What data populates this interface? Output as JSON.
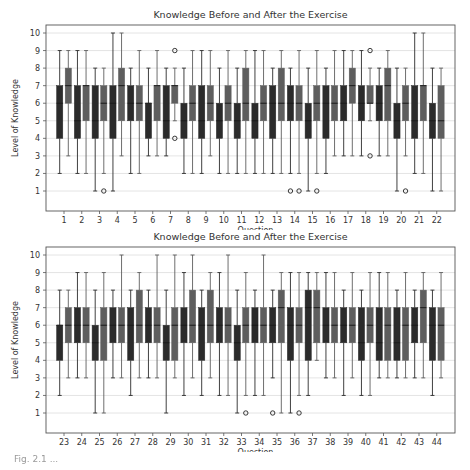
{
  "chart_data": [
    {
      "type": "box",
      "title": "Knowledge Before and After the Exercise",
      "xlabel": "Question",
      "ylabel": "Level of Knowledge",
      "ylim": [
        0,
        10.5
      ],
      "yticks": [
        1,
        2,
        3,
        4,
        5,
        6,
        7,
        8,
        9,
        10
      ],
      "grid": "horizontal",
      "legend": null,
      "series_names": [
        "Before",
        "After"
      ],
      "categories": [
        "1",
        "2",
        "3",
        "4",
        "5",
        "6",
        "7",
        "8",
        "9",
        "10",
        "11",
        "12",
        "13",
        "14",
        "15",
        "16",
        "17",
        "18",
        "19",
        "20",
        "21",
        "22"
      ],
      "boxes": [
        {
          "q": "1",
          "before": {
            "whislo": 2,
            "q1": 4,
            "med": 6,
            "q3": 7,
            "whishi": 9,
            "fliers": []
          },
          "after": {
            "whislo": 3,
            "q1": 6,
            "med": 7,
            "q3": 8,
            "whishi": 9,
            "fliers": []
          }
        },
        {
          "q": "2",
          "before": {
            "whislo": 2,
            "q1": 4,
            "med": 5,
            "q3": 7,
            "whishi": 9,
            "fliers": []
          },
          "after": {
            "whislo": 2,
            "q1": 5,
            "med": 7,
            "q3": 7,
            "whishi": 9,
            "fliers": []
          }
        },
        {
          "q": "3",
          "before": {
            "whislo": 1,
            "q1": 4,
            "med": 5,
            "q3": 7,
            "whishi": 8,
            "fliers": []
          },
          "after": {
            "whislo": 2,
            "q1": 5,
            "med": 6,
            "q3": 7,
            "whishi": 8,
            "fliers": [
              1
            ]
          }
        },
        {
          "q": "4",
          "before": {
            "whislo": 1,
            "q1": 4,
            "med": 6,
            "q3": 7,
            "whishi": 10,
            "fliers": []
          },
          "after": {
            "whislo": 3,
            "q1": 5,
            "med": 7,
            "q3": 8,
            "whishi": 10,
            "fliers": []
          }
        },
        {
          "q": "5",
          "before": {
            "whislo": 2,
            "q1": 5,
            "med": 6,
            "q3": 7,
            "whishi": 8,
            "fliers": []
          },
          "after": {
            "whislo": 2,
            "q1": 5,
            "med": 6,
            "q3": 7,
            "whishi": 9,
            "fliers": []
          }
        },
        {
          "q": "6",
          "before": {
            "whislo": 3,
            "q1": 4,
            "med": 6,
            "q3": 6,
            "whishi": 8,
            "fliers": []
          },
          "after": {
            "whislo": 3,
            "q1": 5,
            "med": 7,
            "q3": 7,
            "whishi": 9,
            "fliers": []
          }
        },
        {
          "q": "7",
          "before": {
            "whislo": 3,
            "q1": 4,
            "med": 5,
            "q3": 7,
            "whishi": 8,
            "fliers": []
          },
          "after": {
            "whislo": 5,
            "q1": 6,
            "med": 7,
            "q3": 7,
            "whishi": 8,
            "fliers": [
              4,
              9
            ]
          }
        },
        {
          "q": "8",
          "before": {
            "whislo": 2,
            "q1": 4,
            "med": 5,
            "q3": 6,
            "whishi": 8,
            "fliers": []
          },
          "after": {
            "whislo": 2,
            "q1": 5,
            "med": 6,
            "q3": 7,
            "whishi": 9,
            "fliers": []
          }
        },
        {
          "q": "9",
          "before": {
            "whislo": 2,
            "q1": 4,
            "med": 5,
            "q3": 7,
            "whishi": 9,
            "fliers": []
          },
          "after": {
            "whislo": 3,
            "q1": 5,
            "med": 6,
            "q3": 7,
            "whishi": 9,
            "fliers": []
          }
        },
        {
          "q": "10",
          "before": {
            "whislo": 2,
            "q1": 4,
            "med": 5,
            "q3": 6,
            "whishi": 8,
            "fliers": []
          },
          "after": {
            "whislo": 2,
            "q1": 5,
            "med": 6,
            "q3": 7,
            "whishi": 9,
            "fliers": []
          }
        },
        {
          "q": "11",
          "before": {
            "whislo": 2,
            "q1": 4,
            "med": 5,
            "q3": 6,
            "whishi": 8,
            "fliers": []
          },
          "after": {
            "whislo": 2,
            "q1": 5,
            "med": 6,
            "q3": 8,
            "whishi": 9,
            "fliers": []
          }
        },
        {
          "q": "12",
          "before": {
            "whislo": 2,
            "q1": 4,
            "med": 5,
            "q3": 6,
            "whishi": 9,
            "fliers": []
          },
          "after": {
            "whislo": 2,
            "q1": 5,
            "med": 6,
            "q3": 7,
            "whishi": 9,
            "fliers": []
          }
        },
        {
          "q": "13",
          "before": {
            "whislo": 2,
            "q1": 4,
            "med": 6,
            "q3": 7,
            "whishi": 8,
            "fliers": []
          },
          "after": {
            "whislo": 2,
            "q1": 5,
            "med": 6,
            "q3": 8,
            "whishi": 9,
            "fliers": []
          }
        },
        {
          "q": "14",
          "before": {
            "whislo": 2,
            "q1": 5,
            "med": 6,
            "q3": 7,
            "whishi": 8,
            "fliers": [
              1
            ]
          },
          "after": {
            "whislo": 2,
            "q1": 5,
            "med": 6,
            "q3": 7,
            "whishi": 9,
            "fliers": [
              1
            ]
          }
        },
        {
          "q": "15",
          "before": {
            "whislo": 1,
            "q1": 4,
            "med": 5,
            "q3": 6,
            "whishi": 8,
            "fliers": []
          },
          "after": {
            "whislo": 2,
            "q1": 5,
            "med": 6,
            "q3": 7,
            "whishi": 9,
            "fliers": [
              1
            ]
          }
        },
        {
          "q": "16",
          "before": {
            "whislo": 2,
            "q1": 4,
            "med": 6,
            "q3": 7,
            "whishi": 8,
            "fliers": []
          },
          "after": {
            "whislo": 3,
            "q1": 5,
            "med": 6,
            "q3": 7,
            "whishi": 9,
            "fliers": []
          }
        },
        {
          "q": "17",
          "before": {
            "whislo": 3,
            "q1": 5,
            "med": 6,
            "q3": 7,
            "whishi": 9,
            "fliers": []
          },
          "after": {
            "whislo": 3,
            "q1": 6,
            "med": 7,
            "q3": 8,
            "whishi": 9,
            "fliers": []
          }
        },
        {
          "q": "18",
          "before": {
            "whislo": 3,
            "q1": 5,
            "med": 6,
            "q3": 7,
            "whishi": 9,
            "fliers": []
          },
          "after": {
            "whislo": 5,
            "q1": 6,
            "med": 6,
            "q3": 7,
            "whishi": 8,
            "fliers": [
              3,
              9
            ]
          }
        },
        {
          "q": "19",
          "before": {
            "whislo": 3,
            "q1": 5,
            "med": 6,
            "q3": 7,
            "whishi": 8,
            "fliers": []
          },
          "after": {
            "whislo": 3,
            "q1": 5,
            "med": 7,
            "q3": 8,
            "whishi": 9,
            "fliers": []
          }
        },
        {
          "q": "20",
          "before": {
            "whislo": 1,
            "q1": 4,
            "med": 5,
            "q3": 6,
            "whishi": 8,
            "fliers": []
          },
          "after": {
            "whislo": 3,
            "q1": 5,
            "med": 6,
            "q3": 7,
            "whishi": 8,
            "fliers": [
              1
            ]
          }
        },
        {
          "q": "21",
          "before": {
            "whislo": 2,
            "q1": 4,
            "med": 5,
            "q3": 7,
            "whishi": 10,
            "fliers": []
          },
          "after": {
            "whislo": 2,
            "q1": 5,
            "med": 7,
            "q3": 7,
            "whishi": 10,
            "fliers": []
          }
        },
        {
          "q": "22",
          "before": {
            "whislo": 1,
            "q1": 4,
            "med": 5,
            "q3": 6,
            "whishi": 8,
            "fliers": []
          },
          "after": {
            "whislo": 1,
            "q1": 4,
            "med": 5,
            "q3": 7,
            "whishi": 8,
            "fliers": []
          }
        }
      ]
    },
    {
      "type": "box",
      "title": "Knowledge Before and After the Exercise",
      "xlabel": "Question",
      "ylabel": "Level of Knowledge",
      "ylim": [
        0,
        10.5
      ],
      "yticks": [
        1,
        2,
        3,
        4,
        5,
        6,
        7,
        8,
        9,
        10
      ],
      "grid": "horizontal",
      "legend": null,
      "series_names": [
        "Before",
        "After"
      ],
      "categories": [
        "23",
        "24",
        "25",
        "26",
        "27",
        "28",
        "29",
        "30",
        "31",
        "32",
        "33",
        "34",
        "35",
        "36",
        "37",
        "38",
        "39",
        "40",
        "41",
        "42",
        "43",
        "44"
      ],
      "boxes": [
        {
          "q": "23",
          "before": {
            "whislo": 2,
            "q1": 4,
            "med": 6,
            "q3": 6,
            "whishi": 8,
            "fliers": []
          },
          "after": {
            "whislo": 3,
            "q1": 5,
            "med": 6,
            "q3": 7,
            "whishi": 8,
            "fliers": []
          }
        },
        {
          "q": "24",
          "before": {
            "whislo": 3,
            "q1": 5,
            "med": 6,
            "q3": 7,
            "whishi": 9,
            "fliers": []
          },
          "after": {
            "whislo": 3,
            "q1": 5,
            "med": 6,
            "q3": 7,
            "whishi": 9,
            "fliers": []
          }
        },
        {
          "q": "25",
          "before": {
            "whislo": 1,
            "q1": 4,
            "med": 5,
            "q3": 6,
            "whishi": 8,
            "fliers": []
          },
          "after": {
            "whislo": 1,
            "q1": 4,
            "med": 6,
            "q3": 7,
            "whishi": 9,
            "fliers": []
          }
        },
        {
          "q": "26",
          "before": {
            "whislo": 3,
            "q1": 5,
            "med": 6,
            "q3": 7,
            "whishi": 8,
            "fliers": []
          },
          "after": {
            "whislo": 3,
            "q1": 5,
            "med": 6,
            "q3": 7,
            "whishi": 10,
            "fliers": []
          }
        },
        {
          "q": "27",
          "before": {
            "whislo": 2,
            "q1": 4,
            "med": 6,
            "q3": 7,
            "whishi": 8,
            "fliers": []
          },
          "after": {
            "whislo": 3,
            "q1": 5,
            "med": 6,
            "q3": 8,
            "whishi": 9,
            "fliers": []
          }
        },
        {
          "q": "28",
          "before": {
            "whislo": 3,
            "q1": 5,
            "med": 6,
            "q3": 7,
            "whishi": 8,
            "fliers": []
          },
          "after": {
            "whislo": 3,
            "q1": 5,
            "med": 6,
            "q3": 7,
            "whishi": 10,
            "fliers": []
          }
        },
        {
          "q": "29",
          "before": {
            "whislo": 1,
            "q1": 4,
            "med": 5,
            "q3": 6,
            "whishi": 8,
            "fliers": []
          },
          "after": {
            "whislo": 3,
            "q1": 4,
            "med": 6,
            "q3": 7,
            "whishi": 10,
            "fliers": []
          }
        },
        {
          "q": "30",
          "before": {
            "whislo": 2,
            "q1": 5,
            "med": 6,
            "q3": 7,
            "whishi": 9,
            "fliers": []
          },
          "after": {
            "whislo": 3,
            "q1": 5,
            "med": 6,
            "q3": 8,
            "whishi": 10,
            "fliers": []
          }
        },
        {
          "q": "31",
          "before": {
            "whislo": 2,
            "q1": 4,
            "med": 6,
            "q3": 7,
            "whishi": 8,
            "fliers": []
          },
          "after": {
            "whislo": 3,
            "q1": 5,
            "med": 6,
            "q3": 8,
            "whishi": 9,
            "fliers": []
          }
        },
        {
          "q": "32",
          "before": {
            "whislo": 2,
            "q1": 5,
            "med": 6,
            "q3": 7,
            "whishi": 9,
            "fliers": []
          },
          "after": {
            "whislo": 2,
            "q1": 5,
            "med": 6,
            "q3": 7,
            "whishi": 10,
            "fliers": []
          }
        },
        {
          "q": "33",
          "before": {
            "whislo": 1,
            "q1": 4,
            "med": 5,
            "q3": 6,
            "whishi": 8,
            "fliers": []
          },
          "after": {
            "whislo": 2,
            "q1": 5,
            "med": 6,
            "q3": 7,
            "whishi": 9,
            "fliers": [
              1
            ]
          }
        },
        {
          "q": "34",
          "before": {
            "whislo": 2,
            "q1": 5,
            "med": 6,
            "q3": 7,
            "whishi": 8,
            "fliers": []
          },
          "after": {
            "whislo": 2,
            "q1": 5,
            "med": 6,
            "q3": 7,
            "whishi": 10,
            "fliers": []
          }
        },
        {
          "q": "35",
          "before": {
            "whislo": 3,
            "q1": 5,
            "med": 6,
            "q3": 7,
            "whishi": 8,
            "fliers": [
              1
            ]
          },
          "after": {
            "whislo": 1,
            "q1": 5,
            "med": 7,
            "q3": 8,
            "whishi": 9,
            "fliers": []
          }
        },
        {
          "q": "36",
          "before": {
            "whislo": 1,
            "q1": 4,
            "med": 6,
            "q3": 7,
            "whishi": 9,
            "fliers": []
          },
          "after": {
            "whislo": 2,
            "q1": 5,
            "med": 6,
            "q3": 7,
            "whishi": 9,
            "fliers": [
              1
            ]
          }
        },
        {
          "q": "37",
          "before": {
            "whislo": 2,
            "q1": 4,
            "med": 7,
            "q3": 8,
            "whishi": 9,
            "fliers": []
          },
          "after": {
            "whislo": 4,
            "q1": 5,
            "med": 7,
            "q3": 8,
            "whishi": 9,
            "fliers": []
          }
        },
        {
          "q": "38",
          "before": {
            "whislo": 3,
            "q1": 5,
            "med": 6,
            "q3": 7,
            "whishi": 9,
            "fliers": []
          },
          "after": {
            "whislo": 3,
            "q1": 5,
            "med": 6,
            "q3": 7,
            "whishi": 9,
            "fliers": []
          }
        },
        {
          "q": "39",
          "before": {
            "whislo": 2,
            "q1": 5,
            "med": 6,
            "q3": 7,
            "whishi": 8,
            "fliers": []
          },
          "after": {
            "whislo": 3,
            "q1": 5,
            "med": 6,
            "q3": 7,
            "whishi": 9,
            "fliers": []
          }
        },
        {
          "q": "40",
          "before": {
            "whislo": 2,
            "q1": 4,
            "med": 5,
            "q3": 7,
            "whishi": 8,
            "fliers": []
          },
          "after": {
            "whislo": 2,
            "q1": 5,
            "med": 6,
            "q3": 7,
            "whishi": 9,
            "fliers": []
          }
        },
        {
          "q": "41",
          "before": {
            "whislo": 3,
            "q1": 4,
            "med": 5,
            "q3": 7,
            "whishi": 9,
            "fliers": []
          },
          "after": {
            "whislo": 3,
            "q1": 4,
            "med": 6,
            "q3": 7,
            "whishi": 9,
            "fliers": []
          }
        },
        {
          "q": "42",
          "before": {
            "whislo": 3,
            "q1": 4,
            "med": 5,
            "q3": 7,
            "whishi": 8,
            "fliers": []
          },
          "after": {
            "whislo": 3,
            "q1": 4,
            "med": 6,
            "q3": 7,
            "whishi": 9,
            "fliers": []
          }
        },
        {
          "q": "43",
          "before": {
            "whislo": 3,
            "q1": 5,
            "med": 6,
            "q3": 7,
            "whishi": 8,
            "fliers": []
          },
          "after": {
            "whislo": 3,
            "q1": 5,
            "med": 7,
            "q3": 8,
            "whishi": 9,
            "fliers": []
          }
        },
        {
          "q": "44",
          "before": {
            "whislo": 2,
            "q1": 4,
            "med": 6,
            "q3": 7,
            "whishi": 8,
            "fliers": []
          },
          "after": {
            "whislo": 3,
            "q1": 4,
            "med": 6,
            "q3": 7,
            "whishi": 9,
            "fliers": []
          }
        }
      ]
    }
  ],
  "colors": {
    "before_box": "#2b2b2b",
    "after_box": "#5e5e5e",
    "whisker": "#333333",
    "median": "#1a1a1a",
    "grid": "#dddddd",
    "axis": "#555555",
    "text": "#333333"
  },
  "caption": "Fig. 2.1 ..."
}
